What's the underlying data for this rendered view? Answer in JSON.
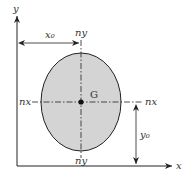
{
  "diagram": {
    "axis_x_label": "x",
    "axis_y_label": "y",
    "centroid_label": "G",
    "neutral_axis_x_left": "nx",
    "neutral_axis_x_right": "nx",
    "neutral_axis_y_top": "ny",
    "neutral_axis_y_bottom": "ny",
    "dim_x0_label": "x₀",
    "dim_y0_label": "y₀",
    "colors": {
      "ellipse_fill": "#d4d4d4",
      "stroke": "#222222"
    }
  }
}
